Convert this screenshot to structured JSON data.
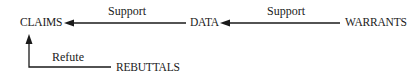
{
  "diagram": {
    "type": "argument-structure",
    "nodes": {
      "claims": {
        "label": "CLAIMS"
      },
      "data": {
        "label": "DATA"
      },
      "warrants": {
        "label": "WARRANTS"
      },
      "rebuttals": {
        "label": "REBUTTALS"
      }
    },
    "edges": [
      {
        "from": "DATA",
        "to": "CLAIMS",
        "label": "Support"
      },
      {
        "from": "WARRANTS",
        "to": "DATA",
        "label": "Support"
      },
      {
        "from": "REBUTTALS",
        "to": "CLAIMS",
        "label": "Refute"
      }
    ],
    "colors": {
      "line": "#1a1a1a",
      "text": "#1a1a1a",
      "background": "#ffffff"
    }
  }
}
